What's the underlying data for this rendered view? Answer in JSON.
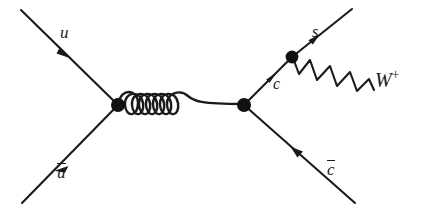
{
  "figure": {
    "kind": "feynman-diagram",
    "background_color": "#ffffff",
    "ink_color": "#1a1a1a",
    "width": 428,
    "height": 212
  },
  "labels": {
    "u": "u",
    "u_bar": "u",
    "c": "c",
    "c_bar": "c",
    "s": "s",
    "w_boson": "W",
    "w_charge": "+"
  },
  "vertices": [
    {
      "name": "left-vertex",
      "x": 118,
      "y": 105,
      "radius": 7.0
    },
    {
      "name": "right-vertex",
      "x": 244,
      "y": 105,
      "radius": 7.0
    },
    {
      "name": "w-vertex",
      "x": 292,
      "y": 57,
      "radius": 6.4
    }
  ],
  "propagators": {
    "gluon": {
      "type": "gluon-spring",
      "loops": 7,
      "from_x": 118,
      "from_y": 105,
      "to_x": 244,
      "to_y": 105
    },
    "w_boson": {
      "type": "wavy",
      "cycles": 5,
      "from_x": 292,
      "from_y": 57,
      "to_x": 374,
      "to_y": 88
    }
  },
  "fermion_lines": [
    {
      "name": "u-incoming",
      "label": "u",
      "from_x": 21,
      "from_y": 10,
      "to_x": 118,
      "to_y": 105,
      "arrow_dir": "down-right"
    },
    {
      "name": "ubar-incoming",
      "label": "u",
      "from_x": 118,
      "from_y": 105,
      "to_x": 22,
      "to_y": 203,
      "arrow_dir": "down-left"
    },
    {
      "name": "c-internal",
      "label": "c",
      "from_x": 244,
      "from_y": 105,
      "to_x": 292,
      "to_y": 57,
      "arrow_dir": "up-right"
    },
    {
      "name": "s-outgoing",
      "label": "s",
      "from_x": 292,
      "from_y": 57,
      "to_x": 352,
      "to_y": 9,
      "arrow_dir": "up-right"
    },
    {
      "name": "cbar-outgoing",
      "label": "c",
      "from_x": 355,
      "from_y": 203,
      "to_x": 244,
      "to_y": 105,
      "arrow_dir": "up-left"
    }
  ]
}
